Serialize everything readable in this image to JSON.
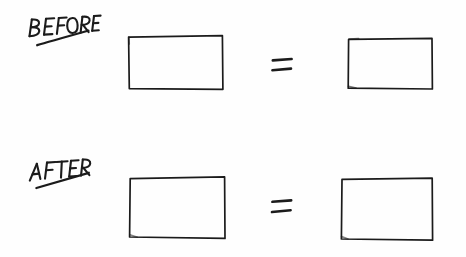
{
  "canvas": {
    "width": 466,
    "height": 257,
    "background_color": "#fefefe",
    "ink_color": "#1b1b1b",
    "medium": "hand-drawn pen sketch"
  },
  "rows": [
    {
      "id": "before",
      "label": "BEFORE",
      "label_underlined": true,
      "left_shape": "rectangle",
      "operator": "=",
      "right_shape": "rectangle"
    },
    {
      "id": "after",
      "label": "AFTER",
      "label_underlined": true,
      "left_shape": "rectangle",
      "operator": "=",
      "right_shape": "rectangle"
    }
  ],
  "operators": {
    "equals_top": "=",
    "equals_bottom": "="
  },
  "labels": {
    "before": "BEFORE",
    "after": "AFTER"
  },
  "shapes": {
    "before_left_rect": "rectangle",
    "before_right_rect": "rectangle",
    "after_left_rect": "rectangle",
    "after_right_rect": "rectangle"
  }
}
